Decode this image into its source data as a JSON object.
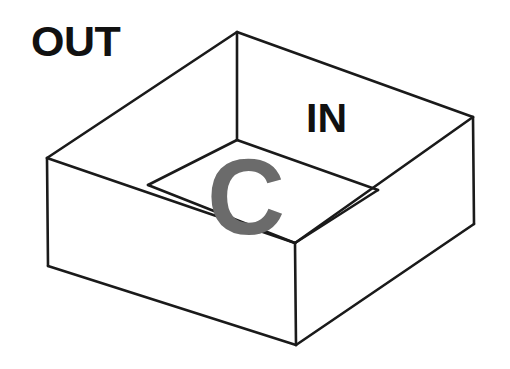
{
  "canvas": {
    "width": 510,
    "height": 369,
    "background_color": "#ffffff"
  },
  "labels": {
    "exterior": "OUT",
    "interior": "IN",
    "watermark": "C"
  },
  "colors": {
    "stroke": "#1a1a1a",
    "fill": "#ffffff",
    "text": "#111111",
    "watermark": "#6b6b6b"
  },
  "diagram": {
    "type": "line-drawing",
    "object": "open-top-rectangular-box",
    "stroke_width": 2.6,
    "vertices": {
      "rim_back": [
        237,
        32
      ],
      "rim_left": [
        47,
        158
      ],
      "rim_right": [
        473,
        117
      ],
      "rim_front": [
        295,
        243
      ],
      "floor_back": [
        237,
        140
      ],
      "floor_left": [
        148,
        185
      ],
      "floor_right": [
        378,
        190
      ],
      "base_left": [
        48,
        266
      ],
      "base_front": [
        296,
        345
      ],
      "base_right": [
        474,
        224
      ]
    },
    "faces": [
      {
        "name": "rim-top-left",
        "points": "47,158 237,32 237,140 148,185"
      },
      {
        "name": "rim-top-right",
        "points": "237,32 473,117 378,190 237,140"
      },
      {
        "name": "rim-top-front-left",
        "points": "47,158 148,185 295,243"
      },
      {
        "name": "rim-top-front-right",
        "points": "473,117 378,190 295,243"
      },
      {
        "name": "inner-floor",
        "points": "148,185 237,140 378,190 295,243"
      },
      {
        "name": "outer-wall-left",
        "points": "47,158 295,243 296,345 48,266"
      },
      {
        "name": "outer-wall-right",
        "points": "295,243 473,117 474,224 296,345"
      }
    ],
    "edges": [
      {
        "name": "rim-back-left",
        "from": "rim_left",
        "to": "rim_back"
      },
      {
        "name": "rim-back-right",
        "from": "rim_back",
        "to": "rim_right"
      },
      {
        "name": "rim-front-left",
        "from": "rim_left",
        "to": "rim_front"
      },
      {
        "name": "rim-front-right",
        "from": "rim_front",
        "to": "rim_right"
      },
      {
        "name": "inner-back-left",
        "from": "floor_left",
        "to": "floor_back"
      },
      {
        "name": "inner-back-right",
        "from": "floor_back",
        "to": "floor_right"
      },
      {
        "name": "inner-front-left",
        "from": "floor_left",
        "to": "rim_front"
      },
      {
        "name": "inner-front-right",
        "from": "rim_front",
        "to": "floor_right"
      },
      {
        "name": "inner-corner-back",
        "from": "rim_back",
        "to": "floor_back"
      },
      {
        "name": "wall-edge-left",
        "from": "rim_left",
        "to": "base_left"
      },
      {
        "name": "wall-edge-front",
        "from": "rim_front",
        "to": "base_front"
      },
      {
        "name": "wall-edge-right",
        "from": "rim_right",
        "to": "base_right"
      },
      {
        "name": "base-left",
        "from": "base_left",
        "to": "base_front"
      },
      {
        "name": "base-right",
        "from": "base_front",
        "to": "base_right"
      }
    ]
  }
}
